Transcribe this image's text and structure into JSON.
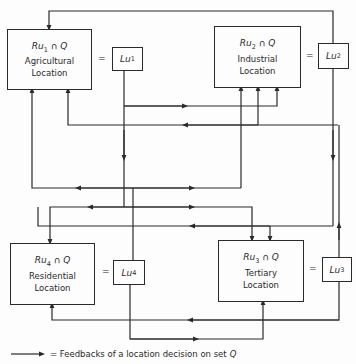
{
  "diagram": {
    "nodes": [
      {
        "id": "ru1",
        "formula_prefix": "Ru",
        "formula_sub": "1",
        "formula_suffix": " ∩ Q",
        "line1": "Agricultural",
        "line2": "Location",
        "equals": "=",
        "l_prefix": "Lu",
        "l_sub": "1"
      },
      {
        "id": "ru2",
        "formula_prefix": "Ru",
        "formula_sub": "2",
        "formula_suffix": " ∩ Q",
        "line1": "Industrial",
        "line2": "Location",
        "equals": "=",
        "l_prefix": "Lu",
        "l_sub": "2"
      },
      {
        "id": "ru3",
        "formula_prefix": "Ru",
        "formula_sub": "3",
        "formula_suffix": " ∩ Q",
        "line1": "Tertiary",
        "line2": "Location",
        "equals": "=",
        "l_prefix": "Lu",
        "l_sub": "3"
      },
      {
        "id": "ru4",
        "formula_prefix": "Ru",
        "formula_sub": "4",
        "formula_suffix": " ∩ Q",
        "line1": "Residential",
        "line2": "Location",
        "equals": "=",
        "l_prefix": "Lu",
        "l_sub": "4"
      }
    ],
    "legend": {
      "text": "= Feedbacks of a location decision on set",
      "set_symbol": "Q"
    },
    "colors": {
      "line": "#2a2a2a",
      "background": "#fdfdfd"
    }
  }
}
